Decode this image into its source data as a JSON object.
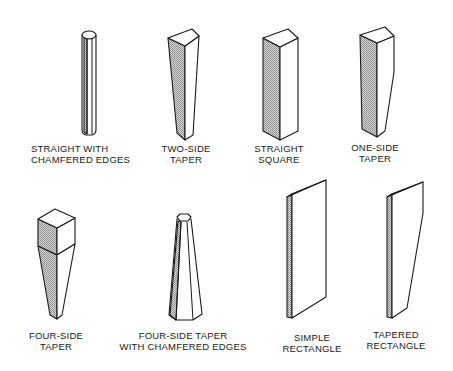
{
  "figure": {
    "shade_color": "#bdbdbd",
    "line_color": "#1a1a1a",
    "background": "#ffffff",
    "shapes": [
      {
        "id": "straight-chamfered",
        "label": [
          "STRAIGHT WITH",
          "CHAMFERED EDGES"
        ],
        "row": 1
      },
      {
        "id": "two-side-taper",
        "label": [
          "TWO-SIDE",
          "TAPER"
        ],
        "row": 1
      },
      {
        "id": "straight-square",
        "label": [
          "STRAIGHT",
          "SQUARE"
        ],
        "row": 1
      },
      {
        "id": "one-side-taper",
        "label": [
          "ONE-SIDE",
          "TAPER"
        ],
        "row": 1
      },
      {
        "id": "four-side-taper",
        "label": [
          "FOUR-SIDE",
          "TAPER"
        ],
        "row": 2
      },
      {
        "id": "four-side-taper-chamfered",
        "label": [
          "FOUR-SIDE TAPER",
          "WITH CHAMFERED EDGES"
        ],
        "row": 2
      },
      {
        "id": "simple-rectangle",
        "label": [
          "SIMPLE",
          "RECTANGLE"
        ],
        "row": 2
      },
      {
        "id": "tapered-rectangle",
        "label": [
          "TAPERED",
          "RECTANGLE"
        ],
        "row": 2
      }
    ]
  }
}
